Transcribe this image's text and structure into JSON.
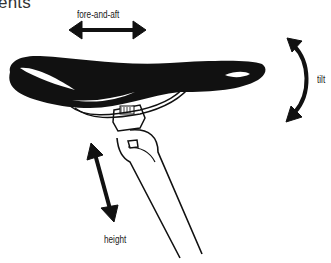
{
  "diagram": {
    "title_fragment": "ents",
    "labels": {
      "fore_aft": "fore-and-aft",
      "tilt": "tilt",
      "height": "height"
    },
    "colors": {
      "ink": "#111111",
      "background": "#ffffff",
      "text": "#222222"
    }
  }
}
